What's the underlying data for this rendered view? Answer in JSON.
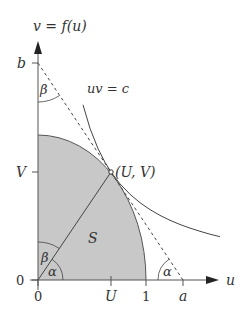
{
  "diagram": {
    "axis_labels": {
      "vertical": "v = f(u)",
      "horizontal": "u"
    },
    "tick_labels": {
      "b": "b",
      "V": "V",
      "origin_v": "0",
      "origin_u": "0",
      "U": "U",
      "one": "1",
      "a": "a"
    },
    "curve_label": "uv = c",
    "point_label": "(U, V)",
    "region_label": "S",
    "angle_labels": {
      "beta_top": "β",
      "beta_origin": "β",
      "alpha_origin": "α",
      "alpha_right": "α"
    },
    "colors": {
      "shaded_region": "#c8c8c8",
      "lines": "#444444",
      "axis": "#555555"
    }
  }
}
